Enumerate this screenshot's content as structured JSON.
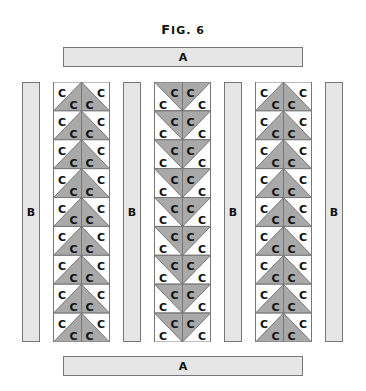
{
  "figure": {
    "title": "Fig. 6",
    "title_prefix": "F",
    "title_rest": "IG. 6"
  },
  "top_bar": {
    "label": "A"
  },
  "bottom_bar": {
    "label": "A"
  },
  "side_strips": [
    {
      "label": "B"
    },
    {
      "label": "B"
    },
    {
      "label": "B"
    },
    {
      "label": "B"
    }
  ],
  "columns": [
    {
      "orientation": "up",
      "rows": 9,
      "cell_label": "C"
    },
    {
      "orientation": "down",
      "rows": 9,
      "cell_label": "C"
    },
    {
      "orientation": "up",
      "rows": 9,
      "cell_label": "C"
    }
  ],
  "colors": {
    "triangle_fill": "#a9a9a9",
    "strip_fill": "#e6e6e6",
    "outline": "#777777"
  }
}
